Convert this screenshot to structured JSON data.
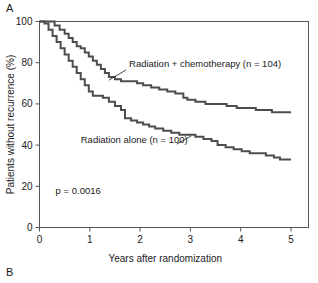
{
  "figure": {
    "panel_label_a": "A",
    "panel_label_b": "B"
  },
  "chart_data": {
    "type": "line",
    "title": "",
    "subtitle": "",
    "xlabel": "Years after randomization",
    "ylabel": "Patients without recurrence (%)",
    "xlim": [
      0,
      5
    ],
    "ylim": [
      0,
      100
    ],
    "xticks": [
      0,
      1,
      2,
      3,
      4,
      5
    ],
    "xtick_labels": [
      "0",
      "1",
      "2",
      "3",
      "4",
      "5"
    ],
    "yticks": [
      0,
      20,
      40,
      60,
      80,
      100
    ],
    "ytick_labels": [
      "0",
      "20",
      "40",
      "60",
      "80",
      "100"
    ],
    "grid": false,
    "legend_position": "inline-annotations",
    "line_color": "#4d4d4d",
    "step_style": "post",
    "annotations": [
      {
        "name": "radiation-chemo-label",
        "text": "Radiation + chemotherapy (n = 104)",
        "x": 1.78,
        "y": 78,
        "leader_from": [
          1.72,
          76.5
        ],
        "leader_to": [
          1.38,
          71.5
        ]
      },
      {
        "name": "radiation-alone-label",
        "text": "Radiation alone (n = 100)",
        "x": 0.82,
        "y": 41,
        "leader_from": [
          2.73,
          40.5
        ],
        "leader_to": [
          3.02,
          44.5
        ]
      },
      {
        "name": "p-value-annotation",
        "text": "p = 0.0016",
        "x": 0.32,
        "y": 16.5
      }
    ],
    "series": [
      {
        "name": "Radiation + chemotherapy (n = 104)",
        "n": 104,
        "label": "Radiation + chemotherapy (n = 104)",
        "color": "#4d4d4d",
        "final_value": 56,
        "x": [
          0.0,
          0.22,
          0.3,
          0.4,
          0.5,
          0.58,
          0.66,
          0.74,
          0.82,
          0.9,
          0.98,
          1.06,
          1.14,
          1.22,
          1.3,
          1.38,
          1.5,
          1.62,
          1.78,
          1.94,
          2.06,
          2.22,
          2.38,
          2.54,
          2.7,
          2.86,
          2.94,
          3.1,
          3.3,
          3.5,
          3.72,
          3.92,
          4.1,
          4.3,
          4.46,
          4.62,
          4.78,
          5.0
        ],
        "y": [
          100,
          100,
          98,
          96,
          94,
          92,
          90,
          88,
          87,
          85,
          83,
          81,
          79,
          77,
          75,
          73,
          72,
          71,
          71,
          70,
          69,
          68,
          67,
          66,
          65,
          63,
          62,
          61,
          60,
          60,
          59,
          58,
          58,
          57,
          57,
          56,
          56,
          56
        ]
      },
      {
        "name": "Radiation alone (n = 100)",
        "n": 100,
        "label": "Radiation alone (n = 100)",
        "color": "#4d4d4d",
        "final_value": 33,
        "x": [
          0.0,
          0.1,
          0.18,
          0.26,
          0.34,
          0.42,
          0.5,
          0.58,
          0.66,
          0.74,
          0.82,
          0.9,
          0.98,
          1.06,
          1.14,
          1.26,
          1.38,
          1.5,
          1.62,
          1.7,
          1.82,
          1.94,
          2.06,
          2.18,
          2.3,
          2.46,
          2.62,
          2.78,
          2.94,
          3.1,
          3.26,
          3.42,
          3.54,
          3.7,
          3.86,
          4.02,
          4.18,
          4.34,
          4.5,
          4.66,
          4.78,
          5.0
        ],
        "y": [
          100,
          99,
          96,
          93,
          90,
          87,
          84,
          81,
          78,
          75,
          72,
          69,
          66,
          64,
          64,
          63,
          61,
          59,
          57,
          53,
          52,
          51,
          50,
          49,
          48,
          47,
          46,
          45,
          45,
          44,
          43,
          42,
          40,
          39,
          38,
          37,
          36,
          36,
          35,
          34,
          33,
          33
        ]
      }
    ]
  }
}
